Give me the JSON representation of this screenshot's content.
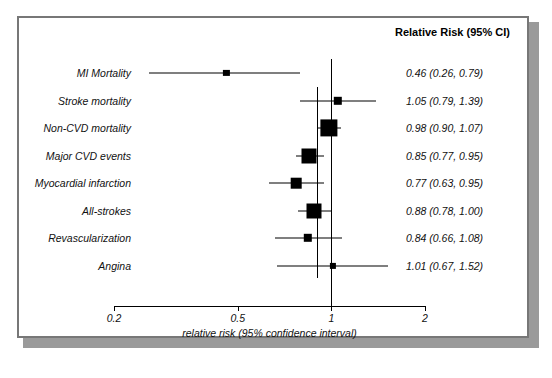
{
  "figure": {
    "right_header": "Relative Risk (95% CI)",
    "axis_title": "relative risk (95% confidence interval)"
  },
  "chart_data": {
    "type": "scatter",
    "subtype": "forest-plot",
    "title": "",
    "xlabel": "relative risk (95% confidence interval)",
    "ylabel": "",
    "xscale": "log",
    "xlim": [
      0.2,
      2.0
    ],
    "xticks": [
      0.2,
      0.5,
      1,
      2
    ],
    "xticklabels": [
      "0.2",
      "0.5",
      "1",
      "2"
    ],
    "grid": false,
    "legend": null,
    "reference_lines": [
      {
        "name": "null-line",
        "x": 1.0
      },
      {
        "name": "pooled-estimate-line",
        "x": 0.9
      }
    ],
    "columns": [
      "Outcome",
      "Relative Risk (95% CI)"
    ],
    "categories": [
      "MI Mortality",
      "Stroke mortality",
      "Non-CVD mortality",
      "Major CVD events",
      "Myocardial infarction",
      "All-strokes",
      "Revascularization",
      "Angina"
    ],
    "points": [
      {
        "label": "MI Mortality",
        "rr": 0.46,
        "lo": 0.26,
        "hi": 0.79,
        "text": "0.46 (0.26, 0.79)",
        "weight": 1
      },
      {
        "label": "Stroke mortality",
        "rr": 1.05,
        "lo": 0.79,
        "hi": 1.39,
        "text": "1.05 (0.79, 1.39)",
        "weight": 2
      },
      {
        "label": "Non-CVD mortality",
        "rr": 0.98,
        "lo": 0.9,
        "hi": 1.07,
        "text": "0.98 (0.90, 1.07)",
        "weight": 6
      },
      {
        "label": "Major CVD events",
        "rr": 0.85,
        "lo": 0.77,
        "hi": 0.95,
        "text": "0.85 (0.77, 0.95)",
        "weight": 5
      },
      {
        "label": "Myocardial infarction",
        "rr": 0.77,
        "lo": 0.63,
        "hi": 0.95,
        "text": "0.77 (0.63, 0.95)",
        "weight": 3
      },
      {
        "label": "All-strokes",
        "rr": 0.88,
        "lo": 0.78,
        "hi": 1.0,
        "text": "0.88 (0.78, 1.00)",
        "weight": 5
      },
      {
        "label": "Revascularization",
        "rr": 0.84,
        "lo": 0.66,
        "hi": 1.08,
        "text": "0.84 (0.66, 1.08)",
        "weight": 2
      },
      {
        "label": "Angina",
        "rr": 1.01,
        "lo": 0.67,
        "hi": 1.52,
        "text": "1.01 (0.67, 1.52)",
        "weight": 1
      }
    ]
  }
}
